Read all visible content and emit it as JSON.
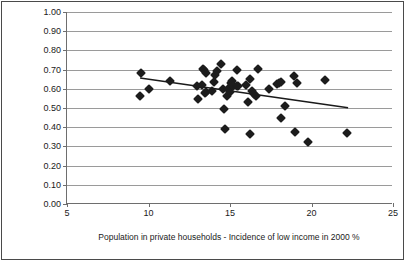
{
  "chart_data": {
    "type": "scatter",
    "title": "",
    "xlabel": "Population in private households - Incidence of low income in 2000 %",
    "ylabel": "Proportion of people who report\n'People can be trusted'",
    "xlim": [
      5,
      25
    ],
    "ylim": [
      0.0,
      1.0
    ],
    "xticks": [
      "5",
      "10",
      "15",
      "20",
      "25"
    ],
    "xtick_values": [
      5,
      10,
      15,
      20,
      25
    ],
    "yticks": [
      "0.00",
      "0.10",
      "0.20",
      "0.30",
      "0.40",
      "0.50",
      "0.60",
      "0.70",
      "0.80",
      "0.90",
      "1.00"
    ],
    "ytick_values": [
      0.0,
      0.1,
      0.2,
      0.3,
      0.4,
      0.5,
      0.6,
      0.7,
      0.8,
      0.9,
      1.0
    ],
    "grid": "horizontal",
    "legend": "none",
    "marker": "diamond",
    "marker_color": "#1c1c1c",
    "trendline": {
      "type": "linear",
      "color": "#1a1a1a",
      "x": [
        9.5,
        22.3
      ],
      "y": [
        0.655,
        0.5
      ]
    },
    "points": [
      [
        9.45,
        0.56
      ],
      [
        9.55,
        0.68
      ],
      [
        10.0,
        0.597
      ],
      [
        11.3,
        0.641
      ],
      [
        13.0,
        0.612
      ],
      [
        13.05,
        0.545
      ],
      [
        13.3,
        0.62
      ],
      [
        13.35,
        0.705
      ],
      [
        13.4,
        0.7
      ],
      [
        13.45,
        0.58
      ],
      [
        13.5,
        0.585
      ],
      [
        13.55,
        0.682
      ],
      [
        13.9,
        0.59
      ],
      [
        14.0,
        0.635
      ],
      [
        14.05,
        0.672
      ],
      [
        14.2,
        0.695
      ],
      [
        14.45,
        0.73
      ],
      [
        14.6,
        0.6
      ],
      [
        14.65,
        0.493
      ],
      [
        14.7,
        0.392
      ],
      [
        14.8,
        0.56
      ],
      [
        14.9,
        0.598
      ],
      [
        15.0,
        0.585
      ],
      [
        15.05,
        0.63
      ],
      [
        15.1,
        0.64
      ],
      [
        15.15,
        0.62
      ],
      [
        15.2,
        0.612
      ],
      [
        15.4,
        0.7
      ],
      [
        15.45,
        0.615
      ],
      [
        15.5,
        0.617
      ],
      [
        16.0,
        0.62
      ],
      [
        16.1,
        0.53
      ],
      [
        16.2,
        0.653
      ],
      [
        16.25,
        0.363
      ],
      [
        16.35,
        0.59
      ],
      [
        16.5,
        0.575
      ],
      [
        16.6,
        0.56
      ],
      [
        16.7,
        0.705
      ],
      [
        17.4,
        0.598
      ],
      [
        17.9,
        0.625
      ],
      [
        18.0,
        0.63
      ],
      [
        18.1,
        0.637
      ],
      [
        18.15,
        0.45
      ],
      [
        18.4,
        0.51
      ],
      [
        18.9,
        0.667
      ],
      [
        19.0,
        0.375
      ],
      [
        19.1,
        0.632
      ],
      [
        19.8,
        0.325
      ],
      [
        20.8,
        0.645
      ],
      [
        22.2,
        0.37
      ]
    ]
  },
  "caption": {
    "text": ""
  }
}
